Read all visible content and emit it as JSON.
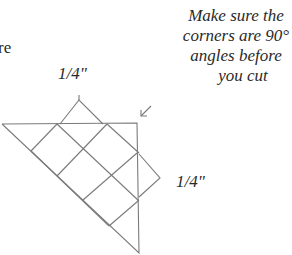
{
  "fragment_text": "re",
  "note": {
    "lines": [
      "Make sure the",
      "corners are 90°",
      "angles before",
      "you cut"
    ]
  },
  "dimensions": {
    "top": "1/4\"",
    "right": "1/4\""
  },
  "colors": {
    "line": "#7a7a7a",
    "text": "#2a2a2a"
  }
}
